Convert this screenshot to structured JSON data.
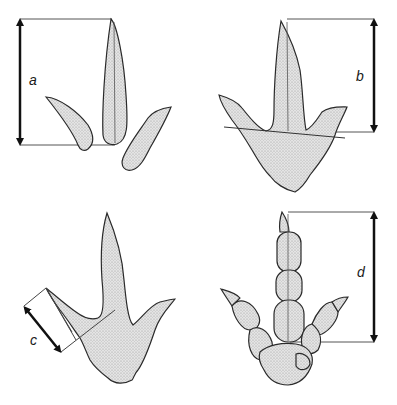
{
  "figure": {
    "panels": [
      {
        "id": "a",
        "label": "a",
        "description": "Digit length measured along isolated digit III impressions"
      },
      {
        "id": "b",
        "label": "b",
        "description": "Digit III length from tip to line connecting hypex points"
      },
      {
        "id": "c",
        "label": "c",
        "description": "Digit II length measured obliquely"
      },
      {
        "id": "d",
        "label": "d",
        "description": "Digit III length with phalangeal pads"
      }
    ],
    "colors": {
      "outline": "#2a2a2a",
      "fill": "#d6d6d6",
      "line": "#555555",
      "arrow": "#111111",
      "background": "#ffffff"
    }
  }
}
